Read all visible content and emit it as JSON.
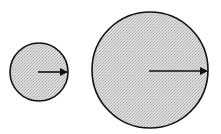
{
  "diagram": {
    "background": "#ffffff",
    "fill_color": "#d4d4d4",
    "stroke_color": "#111111",
    "circles": [
      {
        "name": "small-circle",
        "cx": 39,
        "cy": 72,
        "r": 29,
        "arrow": {
          "x1": 38,
          "y1": 72,
          "x2": 67,
          "y2": 72
        }
      },
      {
        "name": "large-circle",
        "cx": 150,
        "cy": 70,
        "r": 58,
        "arrow": {
          "x1": 149,
          "y1": 71,
          "x2": 207,
          "y2": 71
        }
      }
    ]
  }
}
